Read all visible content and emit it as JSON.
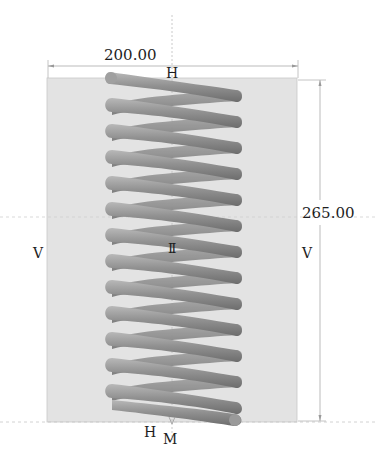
{
  "sketch": {
    "background_color": "#e3e3e3",
    "coil_color": "#8f8f8f",
    "coil_highlight": "#b4b4b4",
    "coil_shadow": "#6e6e6e",
    "line_color": "#a9a9a9",
    "coil_count": 13
  },
  "dimensions": {
    "width_label": "200.00",
    "height_label": "265.00"
  },
  "relations": {
    "top_horizontal": "H",
    "bottom_horizontal": "H",
    "bottom_midpoint": "M",
    "left_vertical": "V",
    "right_vertical": "V",
    "center_parallel": "II"
  }
}
